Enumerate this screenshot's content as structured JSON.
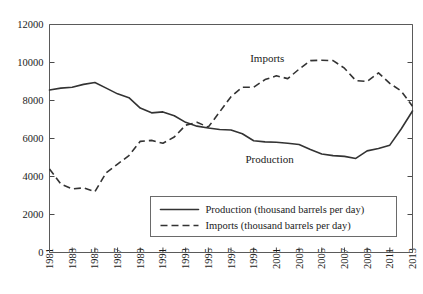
{
  "chart_data": {
    "type": "line",
    "title": "",
    "xlabel": "",
    "ylabel": "",
    "xlim": [
      1981,
      2013
    ],
    "ylim": [
      0,
      12000
    ],
    "grid": false,
    "legend_position": "bottom-center",
    "y_ticks": [
      0,
      2000,
      4000,
      6000,
      8000,
      10000,
      12000
    ],
    "x_ticks": [
      1981,
      1983,
      1985,
      1987,
      1989,
      1991,
      1993,
      1995,
      1997,
      1999,
      2001,
      2003,
      2005,
      2007,
      2009,
      2011,
      2013
    ],
    "x": [
      1981,
      1982,
      1983,
      1984,
      1985,
      1986,
      1987,
      1988,
      1989,
      1990,
      1991,
      1992,
      1993,
      1994,
      1995,
      1996,
      1997,
      1998,
      1999,
      2000,
      2001,
      2002,
      2003,
      2004,
      2005,
      2006,
      2007,
      2008,
      2009,
      2010,
      2011,
      2012,
      2013
    ],
    "series": [
      {
        "name": "Production",
        "style": "solid",
        "color": "#333333",
        "annotation": "Production",
        "values": [
          8550,
          8650,
          8700,
          8850,
          8950,
          8650,
          8350,
          8150,
          7600,
          7350,
          7400,
          7200,
          6850,
          6650,
          6550,
          6470,
          6450,
          6250,
          5880,
          5820,
          5800,
          5750,
          5680,
          5420,
          5180,
          5100,
          5060,
          4950,
          5350,
          5470,
          5650,
          6500,
          7450
        ]
      },
      {
        "name": "Imports",
        "style": "dashed",
        "color": "#333333",
        "annotation": "Imports",
        "values": [
          4400,
          3600,
          3350,
          3400,
          3200,
          4200,
          4650,
          5100,
          5850,
          5900,
          5750,
          6080,
          6700,
          6850,
          6600,
          7400,
          8200,
          8700,
          8700,
          9100,
          9300,
          9150,
          9650,
          10100,
          10120,
          10100,
          9700,
          9050,
          9000,
          9450,
          8900,
          8500,
          7700
        ]
      }
    ]
  },
  "annotations": {
    "imports_label": "Imports",
    "production_label": "Production"
  },
  "legend": {
    "entries": [
      {
        "label": "Production (thousand barrels per day)",
        "style": "solid"
      },
      {
        "label": "Imports (thousand barrels per day)",
        "style": "dashed"
      }
    ]
  },
  "axis": {
    "y_tick_labels": [
      "0",
      "2000",
      "4000",
      "6000",
      "8000",
      "10000",
      "12000"
    ],
    "x_tick_labels": [
      "1981",
      "1983",
      "1985",
      "1987",
      "1989",
      "1991",
      "1993",
      "1995",
      "1997",
      "1999",
      "2001",
      "2003",
      "2005",
      "2007",
      "2009",
      "2011",
      "2013"
    ]
  },
  "colors": {
    "line": "#333333",
    "frame": "#5a5a5a",
    "background": "#ffffff"
  }
}
